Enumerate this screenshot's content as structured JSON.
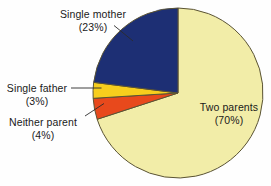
{
  "chart_data": {
    "type": "pie",
    "title": "",
    "subtitle": "",
    "xlabel": "",
    "ylabel": "",
    "legend_position": "none",
    "grid": false,
    "labels_inline": true,
    "total_percent": 100,
    "categories": [
      "Two parents",
      "Single mother",
      "Neither parent",
      "Single father"
    ],
    "values": [
      70,
      23,
      4,
      3
    ],
    "slices": [
      {
        "name": "Two parents",
        "label": "Two parents",
        "percent": 70,
        "percent_text": "(70%)",
        "color": "#f2eda8",
        "start_angle_deg": 0,
        "end_angle_deg": 252,
        "label_placement": "inside-right"
      },
      {
        "name": "Single mother",
        "label": "Single mother",
        "percent": 23,
        "percent_text": "(23%)",
        "color": "#1d2f74",
        "start_angle_deg": 277.2,
        "end_angle_deg": 360,
        "label_placement": "outside-top-left"
      },
      {
        "name": "Single father",
        "label": "Single father",
        "percent": 3,
        "percent_text": "(3%)",
        "color": "#f7ce1d",
        "start_angle_deg": 266.4,
        "end_angle_deg": 277.2,
        "label_placement": "outside-left"
      },
      {
        "name": "Neither parent",
        "label": "Neither parent",
        "percent": 4,
        "percent_text": "(4%)",
        "color": "#e8491c",
        "start_angle_deg": 252,
        "end_angle_deg": 266.4,
        "label_placement": "outside-bottom-left"
      }
    ]
  },
  "labels": {
    "single_mother": {
      "name": "Single mother",
      "percent_text": "(23%)"
    },
    "single_father": {
      "name": "Single father",
      "percent_text": "(3%)"
    },
    "neither_parent": {
      "name": "Neither parent",
      "percent_text": "(4%)"
    },
    "two_parents": {
      "name": "Two parents",
      "percent_text": "(70%)"
    }
  },
  "colors": {
    "two_parents": "#f2eda8",
    "single_mother": "#1d2f74",
    "single_father": "#f7ce1d",
    "neither_parent": "#e8491c",
    "outline": "#5a5334",
    "leader_line": "#2b2b2b",
    "background": "#fefefe",
    "text": "#1a1a1a"
  },
  "geometry": {
    "center_x": 178,
    "center_y": 93,
    "radius": 85
  }
}
